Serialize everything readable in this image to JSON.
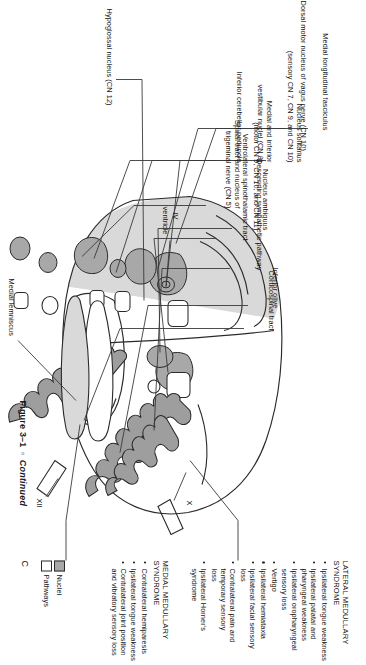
{
  "figure": {
    "caption_number": "Figure 3–1",
    "caption_sep": "▫",
    "caption_word": "Continued",
    "panel_letter": "C",
    "title_semantic": "Medulla cross-section with lateral and medial medullary syndromes"
  },
  "colors": {
    "nuclei_fill": "#a8a8a8",
    "pathway_fill": "#ffffff",
    "territory_shade": "#d9d9d9",
    "olive_fill": "#9e9e9e",
    "outline": "#2a2a2a",
    "text": "#141414"
  },
  "legend": {
    "items": [
      {
        "label": "Nuclei",
        "swatch": "nuclei_fill"
      },
      {
        "label": "Pathways",
        "swatch": "pathway_fill"
      }
    ]
  },
  "leader_labels": {
    "top_row": [
      {
        "id": "mlf",
        "lines": [
          "Medial longitudinal fasciculus"
        ]
      },
      {
        "id": "dmnv",
        "lines": [
          "Dorsal motor nucleus of vagus nerve (CN 10)"
        ]
      },
      {
        "id": "nuc-solitarius",
        "lines": [
          "Nucleus solitarius",
          "(sensory CN 7, CN 9, and CN 10)"
        ]
      },
      {
        "id": "vestibular",
        "lines": [
          "Medial and inferior",
          "vestibular nuclei (CN 8)"
        ]
      },
      {
        "id": "icp",
        "lines": [
          "Inferior cerebellar peduncle"
        ]
      },
      {
        "id": "trigeminal",
        "lines": [
          "Spinal tract and nucleus of",
          "trigeminal nerve (CN 5)"
        ]
      },
      {
        "id": "nuc-ambiguus",
        "lines": [
          "Nucleus ambiguus",
          "(motor CN 9, CN 10, and CN 11)"
        ]
      },
      {
        "id": "vst",
        "lines": [
          "Ventrolateral spinothalamic tract"
        ]
      },
      {
        "id": "desc-symp",
        "lines": [
          "Descending sympathetic pathway"
        ]
      },
      {
        "id": "inferior-olive",
        "lines": [
          "Inferior olive"
        ]
      },
      {
        "id": "cst",
        "lines": [
          "Corticospinal tract"
        ]
      }
    ],
    "left": [
      {
        "id": "hypoglossal",
        "lines": [
          "Hypoglossal nucleus (CN 12)"
        ]
      }
    ],
    "bottom_right": [
      {
        "id": "medial-lemniscus",
        "lines": [
          "Medial lemniscus"
        ]
      }
    ],
    "in_figure": [
      {
        "id": "fourth-ventricle",
        "lines": [
          "IV",
          "ventricle"
        ]
      },
      {
        "id": "nerve-x",
        "lines": [
          "X"
        ]
      },
      {
        "id": "nerve-xii",
        "lines": [
          "XII"
        ]
      }
    ]
  },
  "syndromes": [
    {
      "id": "lateral-medullary",
      "heading": [
        "LATERAL MEDULLARY",
        "SYNDROME"
      ],
      "bullets": [
        [
          "Ipsilateral tongue weakness"
        ],
        [
          "Ipsilateral palatal and",
          "pharyngeal weakness"
        ],
        [
          "Ipsilateral oropharyngeal",
          "sensory loss"
        ],
        [
          "Vertigo"
        ],
        [
          "Ipsilateral hemiataxia"
        ],
        [
          "Ipsilateral facial sensory",
          "loss"
        ],
        [
          "Contralateral pain and",
          "temporary sensory",
          "loss"
        ],
        [
          "Ipsilateral Horner's",
          "syndrome"
        ]
      ]
    },
    {
      "id": "medial-medullary",
      "heading": [
        "MEDIAL MEDULLARY",
        "SYNDROME"
      ],
      "bullets": [
        [
          "Contralateral hemiparesis"
        ],
        [
          "Ipsilateral tongue weakness"
        ],
        [
          "Contralateral joint position",
          "and vibratory sensory loss"
        ]
      ]
    }
  ]
}
